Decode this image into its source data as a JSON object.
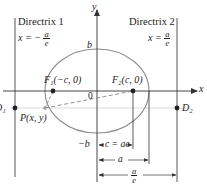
{
  "diagram": {
    "type": "ellipse-focus-directrix",
    "colors": {
      "axes": "#333333",
      "ellipse": "#8c8c8c",
      "directrix": "#444444",
      "dashed": "#888888",
      "guide": "#b0b0b0",
      "points": "#222222"
    },
    "axes": {
      "x_label": "x",
      "y_label": "y",
      "origin_label": "0"
    },
    "directrix1": {
      "title": "Directrix 1",
      "eq_lhs": "x = −",
      "eq_num": "a",
      "eq_den": "e"
    },
    "directrix2": {
      "title": "Directrix 2",
      "eq_lhs": "x =",
      "eq_num": "a",
      "eq_den": "e"
    },
    "points": {
      "F1": "F₁(−c, 0)",
      "F2": "F₂(c, 0)",
      "P": "P(x, y)",
      "D1": "D₁",
      "D2": "D₂"
    },
    "vertex_labels": {
      "top": "b",
      "bottom": "−b"
    },
    "dimensions": {
      "c": "c = ae",
      "a": "a",
      "a_over_e_num": "a",
      "a_over_e_den": "e"
    }
  }
}
